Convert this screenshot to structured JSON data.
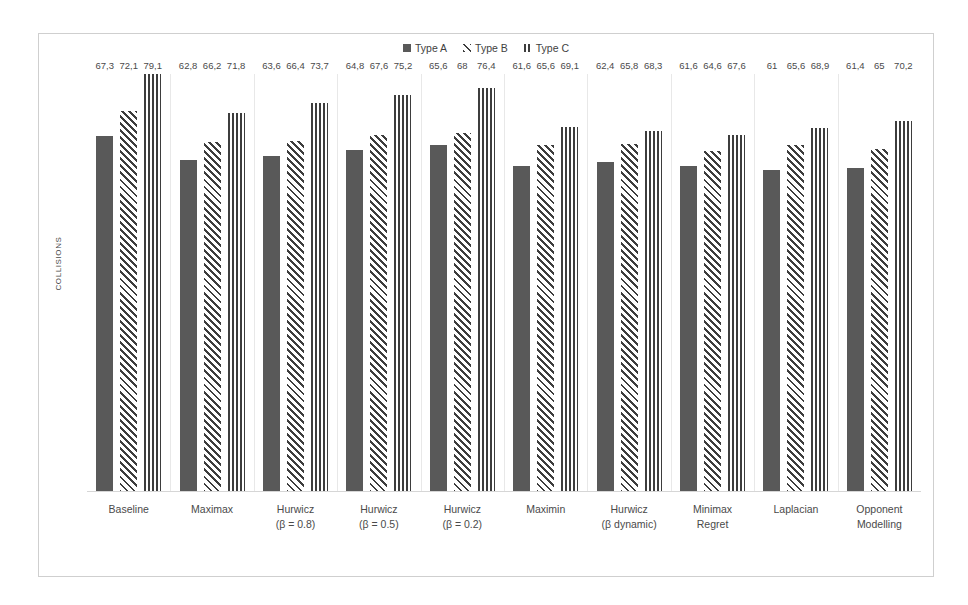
{
  "chart_data": {
    "type": "bar",
    "title": "",
    "xlabel": "",
    "ylabel": "COLLISIONS",
    "ylim": [
      0,
      79.1
    ],
    "grid": false,
    "legend_position": "top-center",
    "decimal_separator": ",",
    "categories": [
      {
        "line1": "Baseline",
        "line2": ""
      },
      {
        "line1": "Maximax",
        "line2": ""
      },
      {
        "line1": "Hurwicz",
        "line2": "(β = 0.8)"
      },
      {
        "line1": "Hurwicz",
        "line2": "(β = 0.5)"
      },
      {
        "line1": "Hurwicz",
        "line2": "(β = 0.2)"
      },
      {
        "line1": "Maximin",
        "line2": ""
      },
      {
        "line1": "Hurwicz",
        "line2": "(β dynamic)"
      },
      {
        "line1": "Minimax",
        "line2": "Regret"
      },
      {
        "line1": "Laplacian",
        "line2": ""
      },
      {
        "line1": "Opponent",
        "line2": "Modelling"
      }
    ],
    "series": [
      {
        "name": "Type A",
        "pattern": "solid",
        "color": "#595959",
        "values": [
          67.3,
          62.8,
          63.6,
          64.8,
          65.6,
          61.6,
          62.4,
          61.6,
          61,
          61.4
        ],
        "labels": [
          "67,3",
          "62,8",
          "63,6",
          "64,8",
          "65,6",
          "61,6",
          "62,4",
          "61,6",
          "61",
          "61,4"
        ]
      },
      {
        "name": "Type B",
        "pattern": "diagonal-stripes",
        "color": "#3d3d3d",
        "values": [
          72.1,
          66.2,
          66.4,
          67.6,
          68,
          65.6,
          65.8,
          64.6,
          65.6,
          65
        ],
        "labels": [
          "72,1",
          "66,2",
          "66,4",
          "67,6",
          "68",
          "65,6",
          "65,8",
          "64,6",
          "65,6",
          "65"
        ]
      },
      {
        "name": "Type C",
        "pattern": "vertical-stripes",
        "color": "#3d3d3d",
        "values": [
          79.1,
          71.8,
          73.7,
          75.2,
          76.4,
          69.1,
          68.3,
          67.6,
          68.9,
          70.2
        ],
        "labels": [
          "79,1",
          "71,8",
          "73,7",
          "75,2",
          "76,4",
          "69,1",
          "68,3",
          "67,6",
          "68,9",
          "70,2"
        ]
      }
    ]
  }
}
